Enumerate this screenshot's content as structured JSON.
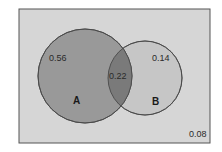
{
  "diagram": {
    "type": "venn",
    "universe": {
      "value": "0.08",
      "x": 19,
      "y": 9,
      "width": 191,
      "height": 134,
      "fill": "#d6d6d6",
      "stroke": "#555555"
    },
    "sets": [
      {
        "name": "A",
        "label": "A",
        "only_value": "0.56",
        "cx": 85,
        "cy": 76,
        "r": 47,
        "fill": "#999999",
        "stroke": "#4a4a4a"
      },
      {
        "name": "B",
        "label": "B",
        "only_value": "0.14",
        "cx": 145,
        "cy": 78,
        "r": 37,
        "fill": "#c6c6c6",
        "stroke": "#4a4a4a"
      }
    ],
    "intersection": {
      "sets": [
        "A",
        "B"
      ],
      "value": "0.22",
      "fill": "#7a7a7a"
    }
  }
}
